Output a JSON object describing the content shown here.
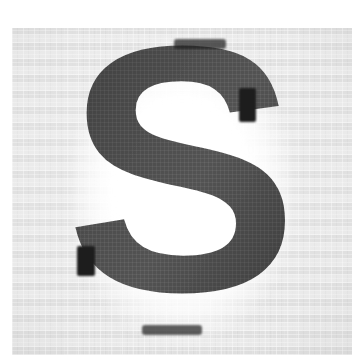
{
  "image": {
    "kind": "scanned-character-image",
    "width": 352,
    "height": 363,
    "description": "Low-resolution scanned bitmap of a single bold capital letter",
    "alt_text": "Pixelated scan of the capital letter S",
    "outer_background_color": "#ffffff"
  },
  "panel": {
    "name": "scan-panel",
    "background_color": "#e4e4e4",
    "left": 12,
    "top": 28,
    "width": 340,
    "height": 327,
    "texture": "jpeg-block-noise"
  },
  "glyph": {
    "character": "S",
    "script": "latin",
    "case": "uppercase",
    "typeface_style": "bold-sans-serif",
    "stroke_color": "#4d4d4d",
    "shadow_color": "#1d1d1d",
    "halo_color": "#ffffff",
    "rendering": "aliased-pixelated",
    "bbox": {
      "left": 78,
      "top": 40,
      "width": 192,
      "height": 295
    }
  },
  "accents": [
    {
      "name": "accent-top-edge",
      "color": "#1d1d1d"
    },
    {
      "name": "accent-upper-right",
      "color": "#1d1d1d"
    },
    {
      "name": "accent-lower-left",
      "color": "#1d1d1d"
    },
    {
      "name": "accent-bottom-edge",
      "color": "#1d1d1d"
    }
  ]
}
